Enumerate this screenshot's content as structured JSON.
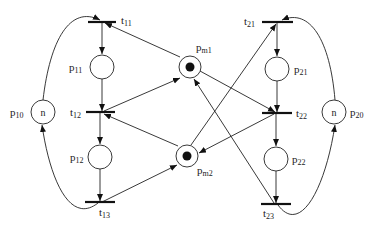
{
  "diagram": {
    "type": "petri-net",
    "places": [
      {
        "id": "p10",
        "base": "p",
        "sub": "10",
        "marking": "n"
      },
      {
        "id": "p11",
        "base": "p",
        "sub": "11",
        "marking": ""
      },
      {
        "id": "p12",
        "base": "p",
        "sub": "12",
        "marking": ""
      },
      {
        "id": "pm1",
        "base": "p",
        "sub": "m1",
        "marking": "token"
      },
      {
        "id": "pm2",
        "base": "p",
        "sub": "m2",
        "marking": "token"
      },
      {
        "id": "p20",
        "base": "p",
        "sub": "20",
        "marking": "n"
      },
      {
        "id": "p21",
        "base": "p",
        "sub": "21",
        "marking": ""
      },
      {
        "id": "p22",
        "base": "p",
        "sub": "22",
        "marking": ""
      }
    ],
    "transitions": [
      {
        "id": "t11",
        "base": "t",
        "sub": "11"
      },
      {
        "id": "t12",
        "base": "t",
        "sub": "12"
      },
      {
        "id": "t13",
        "base": "t",
        "sub": "13"
      },
      {
        "id": "t21",
        "base": "t",
        "sub": "21"
      },
      {
        "id": "t22",
        "base": "t",
        "sub": "22"
      },
      {
        "id": "t23",
        "base": "t",
        "sub": "23"
      }
    ],
    "arcs": [
      [
        "p10",
        "t11"
      ],
      [
        "t11",
        "p11"
      ],
      [
        "p11",
        "t12"
      ],
      [
        "t12",
        "p12"
      ],
      [
        "p12",
        "t13"
      ],
      [
        "t13",
        "p10"
      ],
      [
        "pm1",
        "t11"
      ],
      [
        "t12",
        "pm1"
      ],
      [
        "pm2",
        "t12"
      ],
      [
        "t13",
        "pm2"
      ],
      [
        "p20",
        "t21"
      ],
      [
        "t21",
        "p21"
      ],
      [
        "p21",
        "t22"
      ],
      [
        "t22",
        "p22"
      ],
      [
        "p22",
        "t23"
      ],
      [
        "t23",
        "p20"
      ],
      [
        "pm2",
        "t21"
      ],
      [
        "pm1",
        "t22"
      ],
      [
        "t22",
        "pm2"
      ],
      [
        "t23",
        "pm1"
      ]
    ]
  }
}
